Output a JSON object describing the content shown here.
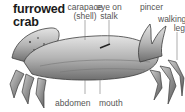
{
  "title": [
    "furrowed",
    "crab"
  ],
  "labels": {
    "carapace": [
      "carapace",
      "(shell)"
    ],
    "eye": [
      "eye on",
      "stalk"
    ],
    "pincer": "pincer",
    "walking_leg": [
      "walking",
      "leg"
    ],
    "abdomen": "abdomen",
    "mouth": "mouth"
  },
  "colors": {
    "text_title": "#1a1a1a",
    "text_label": "#555555",
    "crab_light": "#d8d8d8",
    "crab_mid": "#9a9a9a",
    "crab_dark": "#4a4a4a"
  }
}
